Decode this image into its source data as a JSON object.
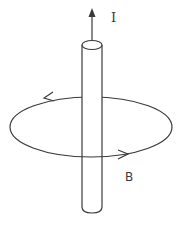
{
  "diagram": {
    "labels": {
      "current": "I",
      "field": "B"
    },
    "colors": {
      "stroke": "#3a3a3a",
      "background": "#ffffff"
    }
  }
}
